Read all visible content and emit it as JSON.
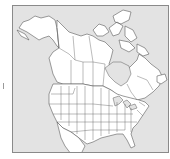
{
  "map": {
    "subject": "North America political outline map (Canada, United States, northern Mexico)",
    "regions_shown": [
      "Alaska",
      "Canada provinces and territories",
      "Contiguous United States states",
      "Hudson Bay",
      "Great Lakes",
      "Florida"
    ],
    "colors": {
      "background": "#e3e3e3",
      "land": "#ffffff",
      "borders": "#5a5a5a",
      "frame": "#8a8a8a"
    },
    "labels": []
  }
}
